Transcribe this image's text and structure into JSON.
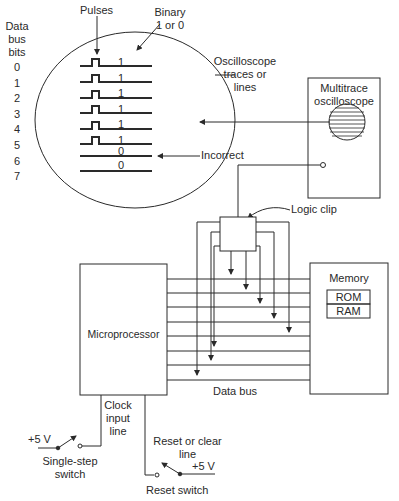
{
  "labels": {
    "data_bus_bits": [
      "Data",
      "bus",
      "bits"
    ],
    "bit_numbers": [
      "0",
      "1",
      "2",
      "3",
      "4",
      "5",
      "6",
      "7"
    ],
    "pulses": "Pulses",
    "binary": [
      "Binary",
      "1 or 0"
    ],
    "trace_values": [
      "1",
      "1",
      "1",
      "1",
      "1",
      "1",
      "0",
      "0"
    ],
    "osc_traces": [
      "Oscilloscope",
      "traces or",
      "lines"
    ],
    "multitrace": [
      "Multitrace",
      "oscilloscope"
    ],
    "incorrect": "Incorrect",
    "logic_clip": "Logic clip",
    "memory": "Memory",
    "rom": "ROM",
    "ram": "RAM",
    "microprocessor": "Microprocessor",
    "data_bus": "Data bus",
    "clock_line": [
      "Clock",
      "input",
      "line"
    ],
    "plus5v_a": "+5 V",
    "single_step": [
      "Single-step",
      "switch"
    ],
    "reset_line": [
      "Reset or clear",
      "line"
    ],
    "plus5v_b": "+5 V",
    "reset_switch": "Reset switch"
  },
  "colors": {
    "line": "#2a2a2a"
  }
}
